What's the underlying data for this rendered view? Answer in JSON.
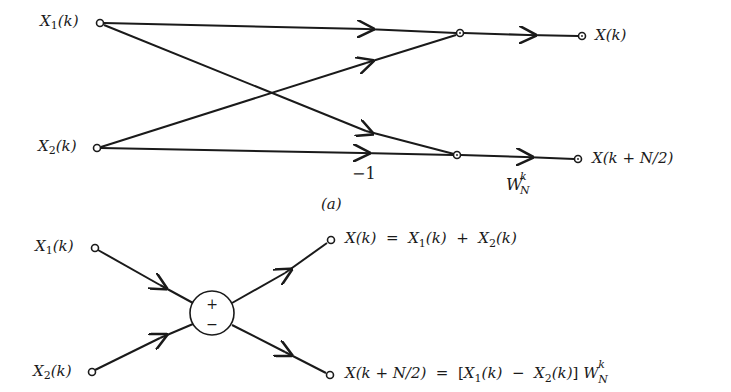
{
  "figure_a": {
    "caption": "(a)",
    "inputs": [
      {
        "name": "X",
        "sub": "1",
        "arg": "(k)"
      },
      {
        "name": "X",
        "sub": "2",
        "arg": "(k)"
      }
    ],
    "outputs": [
      {
        "text": "X(k)"
      },
      {
        "text": "X(k + N/2)"
      }
    ],
    "branch_gain": "−1",
    "twiddle": {
      "base": "W",
      "sup": "k",
      "sub": "N"
    }
  },
  "figure_b": {
    "inputs": [
      {
        "name": "X",
        "sub": "1",
        "arg": "(k)"
      },
      {
        "name": "X",
        "sub": "2",
        "arg": "(k)"
      }
    ],
    "node_signs": {
      "top": "+",
      "bottom": "−"
    },
    "output_top": {
      "lhs": "X(k)",
      "eq": "=",
      "t1": "X",
      "t1sub": "1",
      "t1arg": "(k)",
      "op": "+",
      "t2": "X",
      "t2sub": "2",
      "t2arg": "(k)"
    },
    "output_bottom": {
      "lhs": "X(k + N/2)",
      "eq": "=",
      "open": "[",
      "t1": "X",
      "t1sub": "1",
      "t1arg": "(k)",
      "op": "−",
      "t2": "X",
      "t2sub": "2",
      "t2arg": "(k)",
      "close": "]",
      "tw_base": "W",
      "tw_sup": "k",
      "tw_sub": "N"
    }
  },
  "colors": {
    "ink": "#1a1a1a",
    "background": "#ffffff"
  }
}
